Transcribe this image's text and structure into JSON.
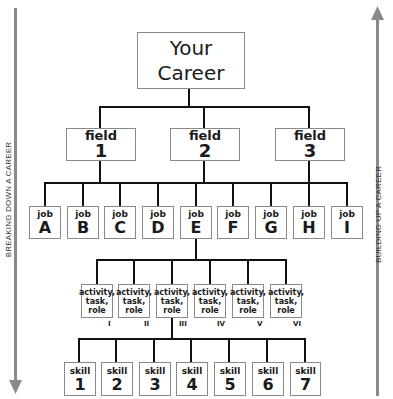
{
  "career": {
    "line1": "Your",
    "line2": "Career"
  },
  "fields": [
    {
      "label": "field",
      "num": "1"
    },
    {
      "label": "field",
      "num": "2"
    },
    {
      "label": "field",
      "num": "3"
    }
  ],
  "jobs": [
    {
      "label": "job",
      "id": "A"
    },
    {
      "label": "job",
      "id": "B"
    },
    {
      "label": "job",
      "id": "C"
    },
    {
      "label": "job",
      "id": "D"
    },
    {
      "label": "job",
      "id": "E"
    },
    {
      "label": "job",
      "id": "F"
    },
    {
      "label": "job",
      "id": "G"
    },
    {
      "label": "job",
      "id": "H"
    },
    {
      "label": "job",
      "id": "I"
    }
  ],
  "activities": [
    {
      "l1": "activity,",
      "l2": "task,",
      "l3": "role",
      "roman": "I"
    },
    {
      "l1": "activity,",
      "l2": "task,",
      "l3": "role",
      "roman": "II"
    },
    {
      "l1": "activity,",
      "l2": "task,",
      "l3": "role",
      "roman": "III"
    },
    {
      "l1": "activity,",
      "l2": "task,",
      "l3": "role",
      "roman": "IV"
    },
    {
      "l1": "activity,",
      "l2": "task,",
      "l3": "role",
      "roman": "V"
    },
    {
      "l1": "activity,",
      "l2": "task,",
      "l3": "role",
      "roman": "VI"
    }
  ],
  "skills": [
    {
      "label": "skill",
      "num": "1"
    },
    {
      "label": "skill",
      "num": "2"
    },
    {
      "label": "skill",
      "num": "3"
    },
    {
      "label": "skill",
      "num": "4"
    },
    {
      "label": "skill",
      "num": "5"
    },
    {
      "label": "skill",
      "num": "6"
    },
    {
      "label": "skill",
      "num": "7"
    }
  ],
  "side": {
    "left": "BREAKING DOWN A CAREER",
    "right": "BUILDING UP A CAREER"
  }
}
